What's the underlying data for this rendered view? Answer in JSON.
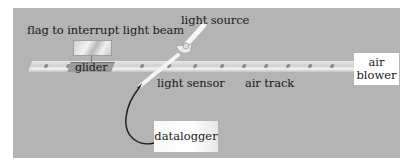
{
  "diagram": {
    "type": "apparatus-setup",
    "background_color": "#b4b4b4",
    "labels": {
      "flag": "flag to interrupt light beam",
      "glider": "glider",
      "light_source": "light source",
      "light_sensor": "light sensor",
      "air_track": "air track",
      "air_blower": "air blower",
      "datalogger": "datalogger"
    },
    "air_blower_lines": [
      "air",
      "blower"
    ]
  }
}
